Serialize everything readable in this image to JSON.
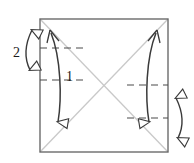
{
  "figure": {
    "title": "",
    "type": "origami-fold-diagram",
    "canvas": {
      "width": 194,
      "height": 163,
      "background": "#ffffff"
    },
    "colors": {
      "square_stroke": "#6b6b6b",
      "diagonal_stroke": "#c9c9c9",
      "arrow_stroke": "#3a3a3a",
      "dash_stroke": "#4a4a4a",
      "label_color": "#1a1a1a"
    },
    "square": {
      "name": "paper-square",
      "left": 40,
      "top": 19,
      "right": 168,
      "bottom": 152,
      "stroke_width": 1.4
    },
    "diagonals": [
      {
        "name": "diagonal-tl-br",
        "x1": 40,
        "y1": 19,
        "x2": 168,
        "y2": 152
      },
      {
        "name": "diagonal-tr-bl",
        "x1": 168,
        "y1": 19,
        "x2": 40,
        "y2": 152
      }
    ],
    "dashed_lines": [
      {
        "name": "dash-left-upper",
        "x1": 40,
        "y1": 48,
        "x2": 82,
        "y2": 48
      },
      {
        "name": "dash-left-lower",
        "x1": 40,
        "y1": 80,
        "x2": 82,
        "y2": 80
      },
      {
        "name": "dash-right-upper",
        "x1": 128,
        "y1": 85,
        "x2": 168,
        "y2": 85
      },
      {
        "name": "dash-right-lower",
        "x1": 128,
        "y1": 118,
        "x2": 168,
        "y2": 118
      }
    ],
    "labels": [
      {
        "name": "fold-label-2",
        "text": "2",
        "x": 16,
        "y": 53,
        "size": 13
      },
      {
        "name": "fold-label-1",
        "text": "1",
        "x": 68,
        "y": 78,
        "size": 13
      }
    ],
    "inner_arrows": [
      {
        "name": "inner-arrow-left-down",
        "direction": "down",
        "description": "curved arrow from top-left corner down to bottom area",
        "path": "M 50,30 C 60,55 62,95 58,126",
        "head_at": "bottom",
        "tail_head": true
      },
      {
        "name": "inner-arrow-right-up",
        "direction": "up",
        "description": "curved arrow from bottom-right area up to top-right corner",
        "path": "M 149,126 C 145,95 148,55 158,30",
        "head_at": "top",
        "tail_head": true
      }
    ],
    "outer_arrows": [
      {
        "name": "outer-arrow-left-double",
        "description": "double headed curved arrow outside left edge, labeled 2",
        "path": "M 33,27 C 25,45 25,58 31,73",
        "label_ref": "2"
      },
      {
        "name": "outer-arrow-right-double",
        "description": "double headed curved arrow outside right edge",
        "path": "M 176,95 C 184,113 184,126 178,142",
        "label_ref": ""
      }
    ]
  }
}
